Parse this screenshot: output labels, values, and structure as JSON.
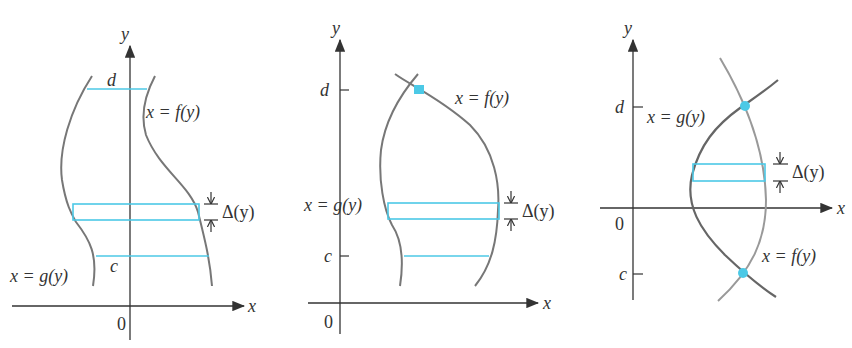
{
  "colors": {
    "strip": "#4cc9e6",
    "curve": "#777777",
    "axis": "#333333",
    "point": "#4cc9e6"
  },
  "panels": [
    {
      "id": "panel-1",
      "axis_x_label": "x",
      "axis_y_label": "y",
      "origin_label": "0",
      "upper_bound_label": "d",
      "lower_bound_label": "c",
      "right_curve_label": "x = f(y)",
      "left_curve_label": "x = g(y)",
      "strip_label": "Δ(y)"
    },
    {
      "id": "panel-2",
      "axis_x_label": "x",
      "axis_y_label": "y",
      "origin_label": "0",
      "upper_bound_label": "d",
      "lower_bound_label": "c",
      "right_curve_label": "x = f(y)",
      "left_curve_label": "x = g(y)",
      "strip_label": "Δ(y)"
    },
    {
      "id": "panel-3",
      "axis_x_label": "x",
      "axis_y_label": "y",
      "origin_label": "0",
      "upper_bound_label": "d",
      "lower_bound_label": "c",
      "upper_curve_label": "x = g(y)",
      "lower_curve_label": "x = f(y)",
      "strip_label": "Δ(y)"
    }
  ]
}
